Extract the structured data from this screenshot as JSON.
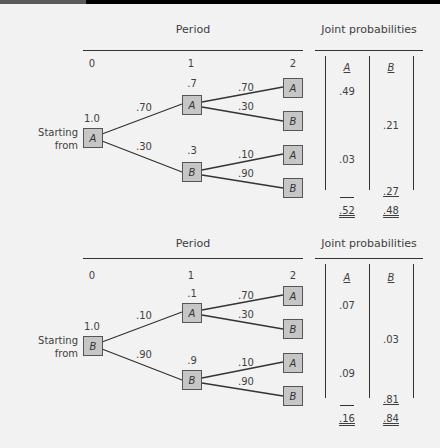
{
  "top_bar": {
    "gray_color": "#5a5a5a",
    "black_color": "#000000"
  },
  "colors": {
    "background": "#f2f2f2",
    "box_fill": "#c6c6c6",
    "box_border": "#555555",
    "line": "#333333",
    "text": "#3f3f3f"
  },
  "diagrams": [
    {
      "period_title": "Period",
      "joint_title": "Joint probabilities",
      "period_labels": [
        "0",
        "1",
        "2"
      ],
      "start_label_line1": "Starting",
      "start_label_line2": "from",
      "start_prob": "1.0",
      "start_state": "A",
      "branch_probs_0_1": [
        ".70",
        ".30"
      ],
      "period1": [
        {
          "state": "A",
          "prob": ".7",
          "branches": [
            {
              "prob": ".70",
              "to": "A"
            },
            {
              "prob": ".30",
              "to": "B"
            }
          ]
        },
        {
          "state": "B",
          "prob": ".3",
          "branches": [
            {
              "prob": ".10",
              "to": "A"
            },
            {
              "prob": ".90",
              "to": "B"
            }
          ]
        }
      ],
      "joint_headers": [
        "A",
        "B"
      ],
      "joint_values": {
        "A1": ".49",
        "B1": ".21",
        "A2": ".03",
        "B2": ".27"
      },
      "totals": {
        "A": ".52",
        "B": ".48"
      }
    },
    {
      "period_title": "Period",
      "joint_title": "Joint probabilities",
      "period_labels": [
        "0",
        "1",
        "2"
      ],
      "start_label_line1": "Starting",
      "start_label_line2": "from",
      "start_prob": "1.0",
      "start_state": "B",
      "branch_probs_0_1": [
        ".10",
        ".90"
      ],
      "period1": [
        {
          "state": "A",
          "prob": ".1",
          "branches": [
            {
              "prob": ".70",
              "to": "A"
            },
            {
              "prob": ".30",
              "to": "B"
            }
          ]
        },
        {
          "state": "B",
          "prob": ".9",
          "branches": [
            {
              "prob": ".10",
              "to": "A"
            },
            {
              "prob": ".90",
              "to": "B"
            }
          ]
        }
      ],
      "joint_headers": [
        "A",
        "B"
      ],
      "joint_values": {
        "A1": ".07",
        "B1": ".03",
        "A2": ".09",
        "B2": ".81"
      },
      "totals": {
        "A": ".16",
        "B": ".84"
      }
    }
  ]
}
